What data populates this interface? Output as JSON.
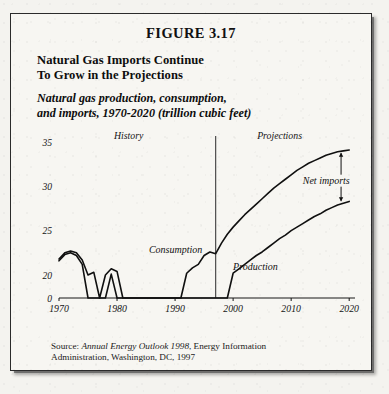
{
  "figure": {
    "number": "FIGURE 3.17",
    "headline_line1": "Natural Gas Imports Continue",
    "headline_line2": "To Grow in the Projections",
    "subtitle_line1": "Natural gas production, consumption,",
    "subtitle_line2": "and imports, 1970-2020 (trillion cubic feet)",
    "source_prefix": "Source: ",
    "source_italic": "Annual Energy Outlook 1998",
    "source_rest": ", Energy Information",
    "source_line2": "Administration, Washington, DC, 1997"
  },
  "chart_data": {
    "type": "line",
    "title": "Natural gas production, consumption, and imports, 1970-2020 (trillion cubic feet)",
    "xlabel": "",
    "ylabel": "trillion cubic feet",
    "xlim": [
      1970,
      2021
    ],
    "ylim": [
      0,
      35
    ],
    "y_broken_axis": true,
    "y_break_between": [
      0,
      20
    ],
    "yticks": [
      0,
      20,
      25,
      30,
      35
    ],
    "ytick_labels": [
      "0",
      "20",
      "25",
      "30",
      "35"
    ],
    "xticks": [
      1970,
      1980,
      1990,
      2000,
      2010,
      2020
    ],
    "xtick_labels": [
      "1970",
      "1980",
      "1990",
      "2000",
      "2010",
      "2020"
    ],
    "grid": false,
    "legend": "inline-annotations",
    "divider_year": 1997,
    "region_labels": [
      {
        "text": "History",
        "x": 1982
      },
      {
        "text": "Projections",
        "x": 2008
      }
    ],
    "annotations": [
      {
        "text": "Consumption",
        "x": 1990.5,
        "y": 21.8
      },
      {
        "text": "Production",
        "x": 2000.5,
        "y": 19.4
      },
      {
        "text": "Net imports",
        "x": 2016.5,
        "y": 30.2
      }
    ],
    "series": [
      {
        "name": "Consumption",
        "x": [
          1970,
          1971,
          1972,
          1973,
          1974,
          1975,
          1976,
          1977,
          1978,
          1979,
          1980,
          1981,
          1982,
          1983,
          1984,
          1985,
          1986,
          1987,
          1988,
          1989,
          1990,
          1991,
          1992,
          1993,
          1994,
          1995,
          1996,
          1997,
          1998,
          1999,
          2000,
          2001,
          2002,
          2003,
          2004,
          2005,
          2006,
          2007,
          2008,
          2009,
          2010,
          2011,
          2012,
          2013,
          2014,
          2015,
          2016,
          2017,
          2018,
          2019,
          2020
        ],
        "values": [
          21.8,
          22.5,
          22.7,
          22.5,
          21.7,
          20.0,
          20.3,
          19.9,
          20.0,
          20.7,
          20.4,
          19.9,
          18.5,
          17.4,
          18.5,
          17.8,
          16.7,
          17.7,
          18.6,
          19.4,
          19.2,
          19.6,
          20.2,
          20.8,
          21.2,
          22.2,
          22.6,
          22.4,
          23.6,
          24.6,
          25.4,
          26.1,
          26.8,
          27.4,
          28.0,
          28.6,
          29.2,
          29.8,
          30.3,
          30.8,
          31.3,
          31.8,
          32.2,
          32.6,
          32.9,
          33.2,
          33.5,
          33.7,
          33.9,
          34.0,
          34.1
        ]
      },
      {
        "name": "Production",
        "x": [
          1970,
          1971,
          1972,
          1973,
          1974,
          1975,
          1976,
          1977,
          1978,
          1979,
          1980,
          1981,
          1982,
          1983,
          1984,
          1985,
          1986,
          1987,
          1988,
          1989,
          1990,
          1991,
          1992,
          1993,
          1994,
          1995,
          1996,
          1997,
          1998,
          1999,
          2000,
          2001,
          2002,
          2003,
          2004,
          2005,
          2006,
          2007,
          2008,
          2009,
          2010,
          2011,
          2012,
          2013,
          2014,
          2015,
          2016,
          2017,
          2018,
          2019,
          2020
        ],
        "values": [
          21.6,
          22.3,
          22.5,
          22.2,
          21.2,
          19.6,
          19.5,
          19.4,
          19.3,
          20.1,
          19.9,
          19.7,
          18.0,
          16.1,
          17.8,
          16.5,
          16.1,
          16.6,
          17.1,
          17.3,
          17.8,
          17.7,
          17.8,
          18.1,
          18.8,
          18.6,
          19.0,
          19.0,
          19.2,
          19.8,
          20.2,
          20.7,
          21.2,
          21.7,
          22.2,
          22.6,
          23.1,
          23.6,
          24.1,
          24.5,
          25.0,
          25.4,
          25.8,
          26.2,
          26.6,
          26.9,
          27.3,
          27.6,
          27.9,
          28.1,
          28.3
        ]
      }
    ]
  }
}
